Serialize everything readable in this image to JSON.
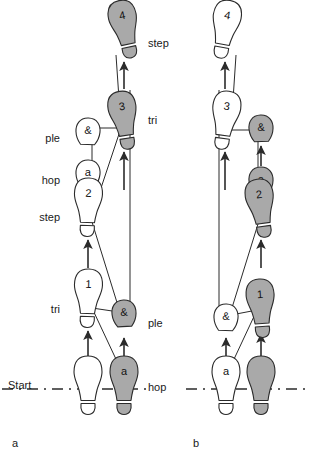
{
  "figure": {
    "type": "footprint-sequence-diagram",
    "caption_ids": [
      "a",
      "b"
    ],
    "start_label": "Start",
    "colors": {
      "shaded_foot_fill": "#a9a9a9",
      "open_foot_fill": "#ffffff",
      "outline": "#2b2b2b",
      "line": "#2b2b2b",
      "text": "#1a1a1a",
      "background": "#ffffff"
    }
  },
  "panels": [
    {
      "id": "a",
      "id_pos": {
        "x": 12,
        "y": 437
      },
      "start_line": {
        "label": "Start",
        "label_pos": {
          "x": 8,
          "y": 380
        },
        "y": 389,
        "x1": 2,
        "x2": 150
      },
      "left_labels": [
        {
          "text": "ple",
          "x": 60,
          "y": 133
        },
        {
          "text": "hop",
          "x": 60,
          "y": 175
        },
        {
          "text": "step",
          "x": 60,
          "y": 212
        },
        {
          "text": "tri",
          "x": 60,
          "y": 304
        }
      ],
      "right_labels": [
        {
          "text": "step",
          "x": 148,
          "y": 38
        },
        {
          "text": "tri",
          "x": 148,
          "y": 115
        },
        {
          "text": "ple",
          "x": 148,
          "y": 318
        },
        {
          "text": "hop",
          "x": 148,
          "y": 382
        }
      ],
      "footprints": [
        {
          "name": "foot-a-4",
          "label": "4",
          "shaded": true,
          "side": "right",
          "cx": 125,
          "cy": 29,
          "angle": -12
        },
        {
          "name": "foot-a-3",
          "label": "3",
          "shaded": true,
          "side": "right",
          "cx": 124,
          "cy": 120,
          "angle": -9
        },
        {
          "name": "foot-a-amp-top",
          "label": "&",
          "shaded": false,
          "side": "left",
          "cx": 88,
          "cy": 131,
          "angle": 2
        },
        {
          "name": "foot-a-a-mid",
          "label": "a",
          "shaded": false,
          "side": "left",
          "cx": 88,
          "cy": 173,
          "angle": 2
        },
        {
          "name": "foot-a-2",
          "label": "2",
          "shaded": false,
          "side": "left",
          "cx": 88,
          "cy": 207,
          "angle": 2
        },
        {
          "name": "foot-a-1",
          "label": "1",
          "shaded": false,
          "side": "left",
          "cx": 88,
          "cy": 298,
          "angle": 2
        },
        {
          "name": "foot-a-amp-low",
          "label": "&",
          "shaded": true,
          "side": "right",
          "cx": 124,
          "cy": 313,
          "angle": -3
        },
        {
          "name": "foot-a-a-start",
          "label": "a",
          "shaded": true,
          "side": "right",
          "cx": 124,
          "cy": 385,
          "angle": 0
        },
        {
          "name": "foot-a-start-open",
          "label": "",
          "shaded": false,
          "side": "left",
          "cx": 88,
          "cy": 385,
          "angle": 0
        }
      ],
      "arrows": [
        {
          "name": "arrow-a-3-to-4",
          "x1": 124,
          "y1": 89,
          "x2": 124,
          "y2": 62
        },
        {
          "name": "arrow-a-amp-to-3",
          "x1": 124,
          "y1": 190,
          "x2": 124,
          "y2": 152
        },
        {
          "name": "arrow-a-1-to-2",
          "x1": 88,
          "y1": 268,
          "x2": 88,
          "y2": 240
        },
        {
          "name": "arrow-a-a-to-amp",
          "x1": 124,
          "y1": 360,
          "x2": 124,
          "y2": 338
        },
        {
          "name": "arrow-a-start-to-1",
          "x1": 88,
          "y1": 360,
          "x2": 88,
          "y2": 331
        }
      ],
      "connectors": [
        {
          "name": "conn-a-start-to-amplow",
          "x1": 122,
          "y1": 372,
          "x2": 92,
          "y2": 308
        },
        {
          "name": "conn-a-1-to-amplow",
          "x1": 92,
          "y1": 308,
          "x2": 119,
          "y2": 312
        },
        {
          "name": "conn-a-amplow-to-2",
          "x1": 119,
          "y1": 309,
          "x2": 92,
          "y2": 222
        },
        {
          "name": "conn-a-2-to-3",
          "x1": 92,
          "y1": 215,
          "x2": 121,
          "y2": 128
        },
        {
          "name": "conn-a-amptop-to-3",
          "x1": 92,
          "y1": 128,
          "x2": 121,
          "y2": 128
        },
        {
          "name": "conn-a-3-to-4",
          "x1": 121,
          "y1": 128,
          "x2": 116,
          "y2": 55
        }
      ],
      "verticals": [
        {
          "name": "vert-a-amptop-to-2",
          "x": 92,
          "y1": 128,
          "x2": 92,
          "y2": 222
        },
        {
          "name": "vert-a-long-right",
          "x": 130,
          "y1": 90,
          "x2": 130,
          "y2": 306
        }
      ]
    },
    {
      "id": "b",
      "id_pos": {
        "x": 193,
        "y": 437
      },
      "start_line": {
        "label": "",
        "label_pos": {
          "x": 0,
          "y": 0
        },
        "y": 389,
        "x1": 186,
        "x2": 310
      },
      "left_labels": [],
      "right_labels": [],
      "footprints": [
        {
          "name": "foot-b-4",
          "label": "4",
          "shaded": false,
          "side": "left",
          "cx": 225,
          "cy": 29,
          "angle": 10
        },
        {
          "name": "foot-b-3",
          "label": "3",
          "shaded": false,
          "side": "left",
          "cx": 225,
          "cy": 120,
          "angle": 8
        },
        {
          "name": "foot-b-amp-top",
          "label": "&",
          "shaded": true,
          "side": "right",
          "cx": 261,
          "cy": 128,
          "angle": -2
        },
        {
          "name": "foot-b-a-mid",
          "label": "a",
          "shaded": true,
          "side": "right",
          "cx": 261,
          "cy": 180,
          "angle": -2
        },
        {
          "name": "foot-b-2",
          "label": "2",
          "shaded": true,
          "side": "right",
          "cx": 261,
          "cy": 208,
          "angle": -8
        },
        {
          "name": "foot-b-1",
          "label": "1",
          "shaded": true,
          "side": "right",
          "cx": 261,
          "cy": 308,
          "angle": -4
        },
        {
          "name": "foot-b-amp-low",
          "label": "&",
          "shaded": false,
          "side": "left",
          "cx": 226,
          "cy": 317,
          "angle": 2
        },
        {
          "name": "foot-b-a-start",
          "label": "a",
          "shaded": false,
          "side": "left",
          "cx": 226,
          "cy": 385,
          "angle": 0
        },
        {
          "name": "foot-b-start-shaded",
          "label": "",
          "shaded": true,
          "side": "right",
          "cx": 261,
          "cy": 385,
          "angle": 0
        }
      ],
      "arrows": [
        {
          "name": "arrow-b-3-to-4",
          "x1": 225,
          "y1": 89,
          "x2": 225,
          "y2": 62
        },
        {
          "name": "arrow-b-amp-to-3",
          "x1": 225,
          "y1": 190,
          "x2": 225,
          "y2": 152
        },
        {
          "name": "arrow-b-a-to-amp",
          "x1": 261,
          "y1": 166,
          "x2": 261,
          "y2": 146
        },
        {
          "name": "arrow-b-1-to-2",
          "x1": 261,
          "y1": 268,
          "x2": 261,
          "y2": 240
        },
        {
          "name": "arrow-b-start-to-1",
          "x1": 261,
          "y1": 360,
          "x2": 261,
          "y2": 334
        },
        {
          "name": "arrow-b-a-to-amplow",
          "x1": 226,
          "y1": 360,
          "x2": 226,
          "y2": 338
        }
      ],
      "connectors": [
        {
          "name": "conn-b-start-to-1",
          "x1": 228,
          "y1": 372,
          "x2": 257,
          "y2": 310
        },
        {
          "name": "conn-b-1-to-amplow",
          "x1": 257,
          "y1": 310,
          "x2": 231,
          "y2": 315
        },
        {
          "name": "conn-b-amplow-to-2",
          "x1": 231,
          "y1": 311,
          "x2": 258,
          "y2": 224
        },
        {
          "name": "conn-b-amptop-to-3",
          "x1": 231,
          "y1": 130,
          "x2": 257,
          "y2": 130
        },
        {
          "name": "conn-b-3-to-4",
          "x1": 231,
          "y1": 130,
          "x2": 236,
          "y2": 55
        }
      ],
      "verticals": [
        {
          "name": "vert-b-amptop-down",
          "x": 258,
          "y1": 130,
          "x2": 258,
          "y2": 224
        },
        {
          "name": "vert-b-long-left",
          "x": 219,
          "y1": 90,
          "x2": 219,
          "y2": 310
        }
      ]
    }
  ]
}
